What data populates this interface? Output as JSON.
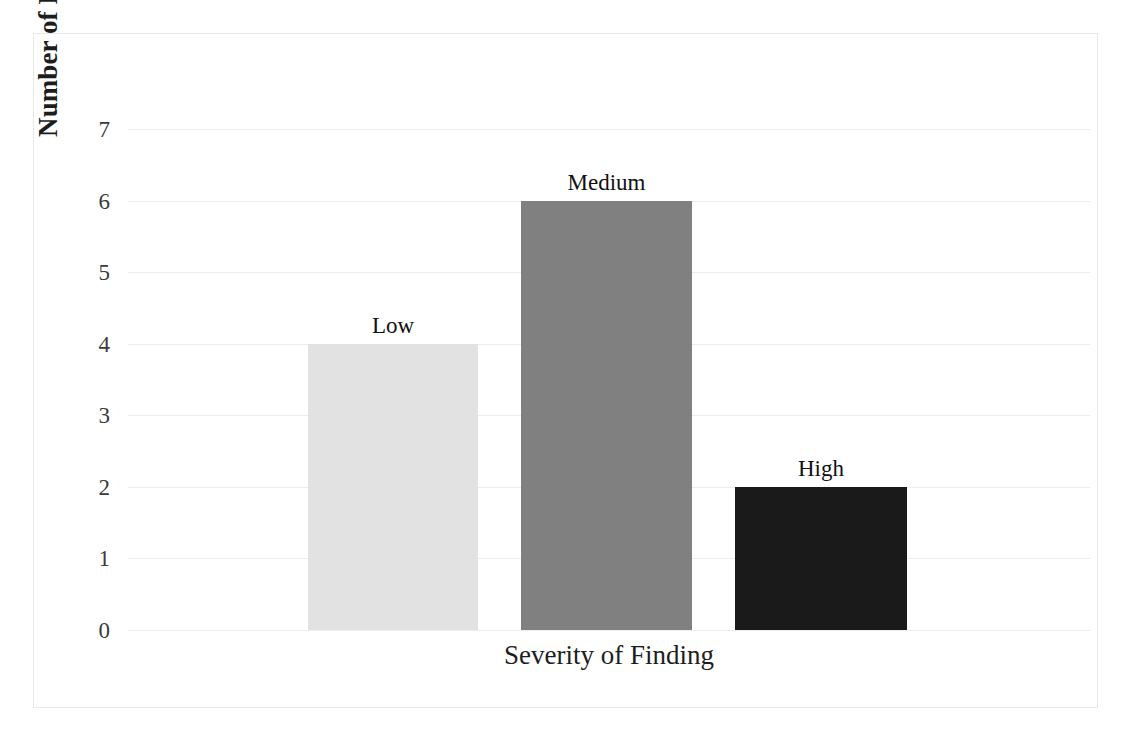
{
  "chart_data": {
    "type": "bar",
    "title": "",
    "subtitle": "",
    "xlabel": "Severity of Finding",
    "ylabel": "Number of Findings",
    "categories": [
      "Low",
      "Medium",
      "High"
    ],
    "values": [
      4,
      6,
      2
    ],
    "bar_colors": [
      "#e2e2e2",
      "#808080",
      "#1a1a1a"
    ],
    "ylim": [
      0,
      7
    ],
    "ytick_labels": [
      "7",
      "6",
      "5",
      "4",
      "3",
      "2",
      "1",
      "0"
    ],
    "ytick_values": [
      7,
      6,
      5,
      4,
      3,
      2,
      1,
      0
    ],
    "grid": true,
    "gridline_color": "#ededed",
    "legend": "none",
    "data_labels_shown": true,
    "data_label_text": [
      "Low",
      "Medium",
      "High"
    ],
    "border_color": "#e8e8e8",
    "background_color": "#ffffff"
  }
}
